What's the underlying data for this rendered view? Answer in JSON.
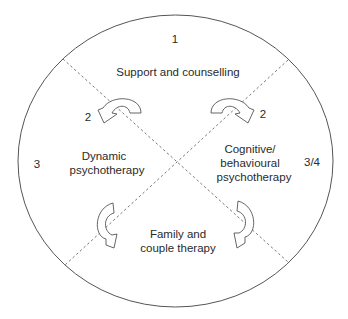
{
  "diagram": {
    "type": "circular-quadrant-model",
    "outer_shape": "ellipse",
    "regions": [
      {
        "id": "top",
        "label_lines": [
          "Support and counselling"
        ],
        "number": "1"
      },
      {
        "id": "left",
        "label_lines": [
          "Dynamic",
          "psychotherapy"
        ],
        "number": "3"
      },
      {
        "id": "right",
        "label_lines": [
          "Cognitive/",
          "behavioural",
          "psychotherapy"
        ],
        "number": "3/4"
      },
      {
        "id": "bottom",
        "label_lines": [
          "Family and",
          "couple therapy"
        ],
        "number": ""
      }
    ],
    "arrows": [
      {
        "id": "top-left",
        "label": "2",
        "direction": "from support to dynamic"
      },
      {
        "id": "top-right",
        "label": "2",
        "direction": "from support to cognitive/behavioural"
      },
      {
        "id": "bottom-left",
        "label": "",
        "direction": "from dynamic to family"
      },
      {
        "id": "bottom-right",
        "label": "",
        "direction": "from cognitive/behavioural to family"
      }
    ],
    "dividers": "two dashed diagonals crossing at centre"
  },
  "labels": {
    "top_number": "1",
    "left_number": "3",
    "right_number": "3/4",
    "arrow_top_left_number": "2",
    "arrow_top_right_number": "2",
    "top_region": "Support and counselling",
    "left_region_line1": "Dynamic",
    "left_region_line2": "psychotherapy",
    "right_region_line1": "Cognitive/",
    "right_region_line2": "behavioural",
    "right_region_line3": "psychotherapy",
    "bottom_region_line1": "Family and",
    "bottom_region_line2": "couple therapy"
  }
}
